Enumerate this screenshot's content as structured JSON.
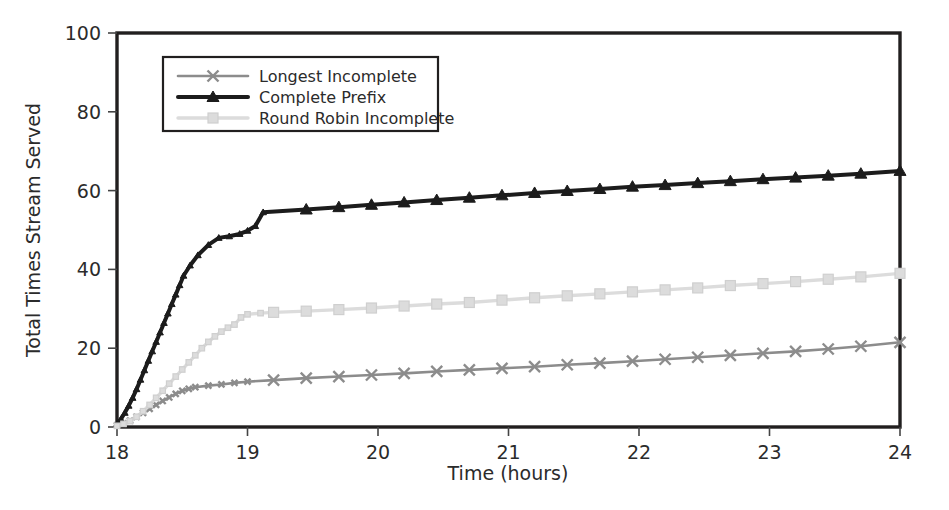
{
  "chart_data": {
    "type": "line",
    "title": "",
    "xlabel": "Time (hours)",
    "ylabel": "Total Times Stream Served",
    "xlim": [
      18,
      24
    ],
    "ylim": [
      0,
      100
    ],
    "xticks": [
      18,
      19,
      20,
      21,
      22,
      23,
      24
    ],
    "xtick_labels": [
      "18",
      "19",
      "20",
      "21",
      "22",
      "23",
      "24"
    ],
    "yticks": [
      0,
      20,
      40,
      60,
      80,
      100
    ],
    "ytick_labels": [
      "0",
      "20",
      "40",
      "60",
      "80",
      "100"
    ],
    "grid": false,
    "legend_position": "upper left",
    "series": [
      {
        "name": "Longest Incomplete",
        "color": "#8c8c8c",
        "marker": "x-cross",
        "linewidth": 2.6,
        "x": [
          18.0,
          18.05,
          18.1,
          18.15,
          18.2,
          18.25,
          18.3,
          18.35,
          18.4,
          18.45,
          18.5,
          18.55,
          18.6,
          18.7,
          18.8,
          18.9,
          19.0,
          19.2,
          19.45,
          19.7,
          19.95,
          20.2,
          20.45,
          20.7,
          20.95,
          21.2,
          21.45,
          21.7,
          21.95,
          22.2,
          22.45,
          22.7,
          22.95,
          23.2,
          23.45,
          23.7,
          24.0
        ],
        "y": [
          0.4,
          0.9,
          1.6,
          2.6,
          3.6,
          4.6,
          5.6,
          6.6,
          7.5,
          8.4,
          9.2,
          9.7,
          10.1,
          10.5,
          10.8,
          11.2,
          11.5,
          11.9,
          12.4,
          12.8,
          13.2,
          13.6,
          14.1,
          14.5,
          14.9,
          15.3,
          15.8,
          16.2,
          16.7,
          17.2,
          17.7,
          18.2,
          18.7,
          19.2,
          19.8,
          20.5,
          21.5
        ]
      },
      {
        "name": "Complete Prefix",
        "color": "#1c1c1c",
        "marker": "triangle",
        "linewidth": 4.0,
        "x": [
          18.0,
          18.03,
          18.06,
          18.09,
          18.12,
          18.15,
          18.18,
          18.21,
          18.24,
          18.27,
          18.3,
          18.33,
          18.36,
          18.39,
          18.42,
          18.45,
          18.48,
          18.51,
          18.56,
          18.62,
          18.7,
          18.78,
          18.86,
          18.94,
          19.0,
          19.06,
          19.12,
          19.45,
          19.7,
          19.95,
          20.2,
          20.45,
          20.7,
          20.95,
          21.2,
          21.45,
          21.7,
          21.95,
          22.2,
          22.45,
          22.7,
          22.95,
          23.2,
          23.45,
          23.7,
          24.0
        ],
        "y": [
          0.8,
          2.0,
          3.6,
          5.4,
          7.4,
          9.6,
          12.0,
          14.4,
          16.8,
          19.2,
          21.6,
          24.0,
          26.4,
          28.8,
          31.2,
          33.6,
          36.0,
          38.4,
          41.0,
          43.6,
          46.2,
          48.0,
          48.4,
          49.0,
          49.8,
          51.0,
          54.5,
          55.2,
          55.8,
          56.4,
          57.0,
          57.6,
          58.2,
          58.8,
          59.4,
          59.9,
          60.4,
          61.0,
          61.4,
          61.9,
          62.4,
          62.9,
          63.3,
          63.8,
          64.3,
          65.0
        ]
      },
      {
        "name": "Round Robin Incomplete",
        "color": "#dcdcdc",
        "marker": "square",
        "linewidth": 3.4,
        "x": [
          18.0,
          18.05,
          18.1,
          18.15,
          18.2,
          18.25,
          18.3,
          18.35,
          18.4,
          18.45,
          18.5,
          18.55,
          18.6,
          18.65,
          18.7,
          18.75,
          18.8,
          18.85,
          18.9,
          18.95,
          19.0,
          19.1,
          19.2,
          19.45,
          19.7,
          19.95,
          20.2,
          20.45,
          20.7,
          20.95,
          21.2,
          21.45,
          21.7,
          21.95,
          22.2,
          22.45,
          22.7,
          22.95,
          23.2,
          23.45,
          23.7,
          24.0
        ],
        "y": [
          0.3,
          0.8,
          1.5,
          2.6,
          4.0,
          5.6,
          7.4,
          9.2,
          11.0,
          12.8,
          14.6,
          16.4,
          18.2,
          20.0,
          21.6,
          23.0,
          24.2,
          25.2,
          26.0,
          27.8,
          28.6,
          28.9,
          29.1,
          29.4,
          29.8,
          30.2,
          30.7,
          31.2,
          31.6,
          32.2,
          32.8,
          33.3,
          33.8,
          34.3,
          34.8,
          35.3,
          35.9,
          36.4,
          36.9,
          37.5,
          38.1,
          39.0
        ]
      }
    ]
  },
  "legend": {
    "items": [
      {
        "label": "Longest Incomplete"
      },
      {
        "label": "Complete Prefix"
      },
      {
        "label": "Round Robin Incomplete"
      }
    ]
  },
  "axes": {
    "x_title": "Time (hours)",
    "y_title": "Total Times Stream Served"
  }
}
